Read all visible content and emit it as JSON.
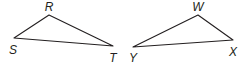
{
  "diagram": {
    "stroke_color": "#231f20",
    "background": "#ffffff",
    "triangles": [
      {
        "name": "RST",
        "vertices": [
          {
            "label": "R",
            "x": 49,
            "y": 15,
            "lx": 49,
            "ly": 11
          },
          {
            "label": "S",
            "x": 14,
            "y": 38,
            "lx": 13,
            "ly": 54
          },
          {
            "label": "T",
            "x": 113,
            "y": 46,
            "lx": 113,
            "ly": 62
          }
        ]
      },
      {
        "name": "WXY",
        "vertices": [
          {
            "label": "W",
            "x": 198,
            "y": 15,
            "lx": 198,
            "ly": 11
          },
          {
            "label": "X",
            "x": 233,
            "y": 40,
            "lx": 233,
            "ly": 56
          },
          {
            "label": "Y",
            "x": 133,
            "y": 47,
            "lx": 133,
            "ly": 62
          }
        ]
      }
    ]
  }
}
